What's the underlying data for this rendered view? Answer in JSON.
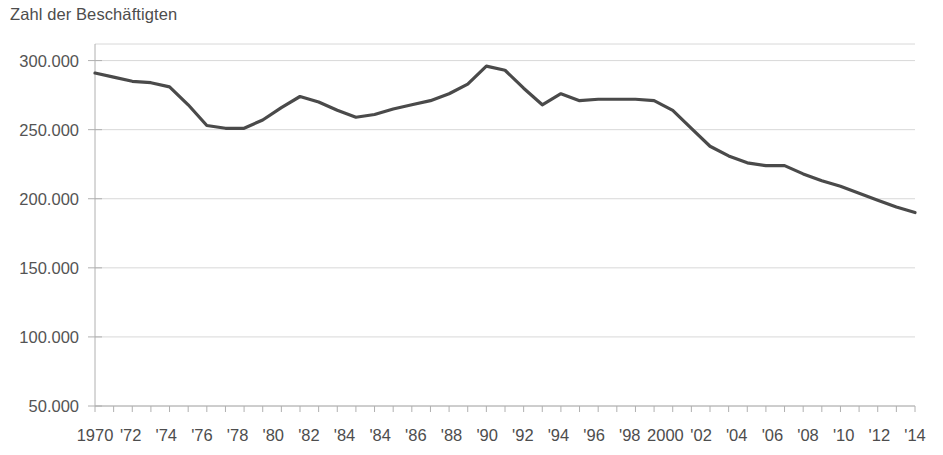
{
  "chart_data": {
    "type": "line",
    "title": "Zahl der Beschäftigten",
    "xlabel": "",
    "ylabel": "",
    "ylim": [
      50000,
      312000
    ],
    "xlim": [
      1970,
      2014
    ],
    "grid": true,
    "legend": "none",
    "line_color": "#4a4a4a",
    "grid_color": "#d8d8d8",
    "axis_color": "#b0b0b0",
    "text_color": "#4d4d4d",
    "y_ticks": [
      50000,
      100000,
      150000,
      200000,
      250000,
      300000
    ],
    "y_tick_labels": [
      "50.000",
      "100.000",
      "150.000",
      "200.000",
      "250.000",
      "300.000"
    ],
    "x_tick_years": [
      1970,
      1971,
      1972,
      1973,
      1974,
      1975,
      1976,
      1977,
      1978,
      1979,
      1980,
      1981,
      1982,
      1983,
      1984,
      1985,
      1986,
      1987,
      1988,
      1989,
      1990,
      1991,
      1992,
      1993,
      1994,
      1995,
      1996,
      1997,
      1998,
      1999,
      2000,
      2001,
      2002,
      2003,
      2004,
      2005,
      2006,
      2007,
      2008,
      2009,
      2010,
      2011,
      2012,
      2013,
      2014
    ],
    "x_labeled_years": [
      1970,
      1972,
      1974,
      1976,
      1978,
      1980,
      1982,
      1984,
      1985,
      1986,
      1988,
      1990,
      1992,
      1994,
      1996,
      1998,
      2000,
      2002,
      2004,
      2006,
      2008,
      2010,
      2012,
      2014
    ],
    "x_tick_labels": [
      "1970",
      "'72",
      "'74",
      "'76",
      "'78",
      "'80",
      "'82",
      "'84",
      "'84",
      "'86",
      "'88",
      "'90",
      "'92",
      "'94",
      "'96",
      "'98",
      "2000",
      "'02",
      "'04",
      "'06",
      "'08",
      "'10",
      "'12",
      "'14"
    ],
    "x": [
      1970,
      1971,
      1972,
      1973,
      1974,
      1975,
      1976,
      1977,
      1978,
      1979,
      1980,
      1981,
      1982,
      1983,
      1984,
      1985,
      1986,
      1987,
      1988,
      1989,
      1990,
      1991,
      1992,
      1993,
      1994,
      1995,
      1996,
      1997,
      1998,
      1999,
      2000,
      2001,
      2002,
      2003,
      2004,
      2005,
      2006,
      2007,
      2008,
      2009,
      2010,
      2011,
      2012,
      2013,
      2014
    ],
    "values": [
      291000,
      288000,
      285000,
      284000,
      281000,
      268000,
      253000,
      251000,
      251000,
      257000,
      266000,
      274000,
      270000,
      264000,
      259000,
      261000,
      265000,
      268000,
      271000,
      276000,
      283000,
      296000,
      293000,
      280000,
      268000,
      276000,
      271000,
      272000,
      272000,
      272000,
      271000,
      264000,
      251000,
      238000,
      231000,
      226000,
      224000,
      224000,
      218000,
      213000,
      209000,
      204000,
      199000,
      194000,
      190000
    ]
  }
}
